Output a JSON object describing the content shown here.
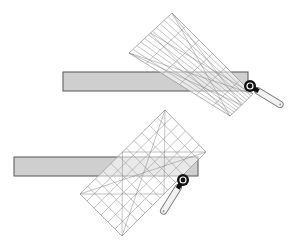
{
  "diagram": {
    "title": "",
    "colors": {
      "background": "#ffffff",
      "bar_fill": "#cfcfcf",
      "bar_stroke": "#555555",
      "grid_line": "#9a9a9a",
      "grid_diagonal": "#7a7a7a",
      "cutter_wheel": "#111111",
      "cutter_handle_fill": "#f2f2f2",
      "cutter_handle_stroke": "#777777"
    },
    "figures": [
      {
        "id": "top",
        "bar": {
          "x1": 63,
          "y1": 72,
          "x2": 248,
          "y2": 91
        },
        "ruler": {
          "top": [
            172,
            13
          ],
          "left": [
            129,
            53
          ],
          "bottom": [
            230,
            116
          ],
          "right": [
            253,
            94
          ],
          "cols": 6,
          "rows": 11
        },
        "cutter": {
          "wheel": [
            250,
            86
          ],
          "handle_end": [
            281,
            105
          ]
        }
      },
      {
        "id": "bottom",
        "bar": {
          "x1": 14,
          "y1": 157,
          "x2": 198,
          "y2": 176
        },
        "ruler": {
          "top": [
            165,
            110
          ],
          "left": [
            80,
            194
          ],
          "bottom": [
            122,
            236
          ],
          "right": [
            206,
            152
          ],
          "cols": 6,
          "rows": 11
        },
        "cutter": {
          "wheel": [
            183,
            180
          ],
          "handle_end": [
            163,
            212
          ]
        }
      }
    ]
  }
}
